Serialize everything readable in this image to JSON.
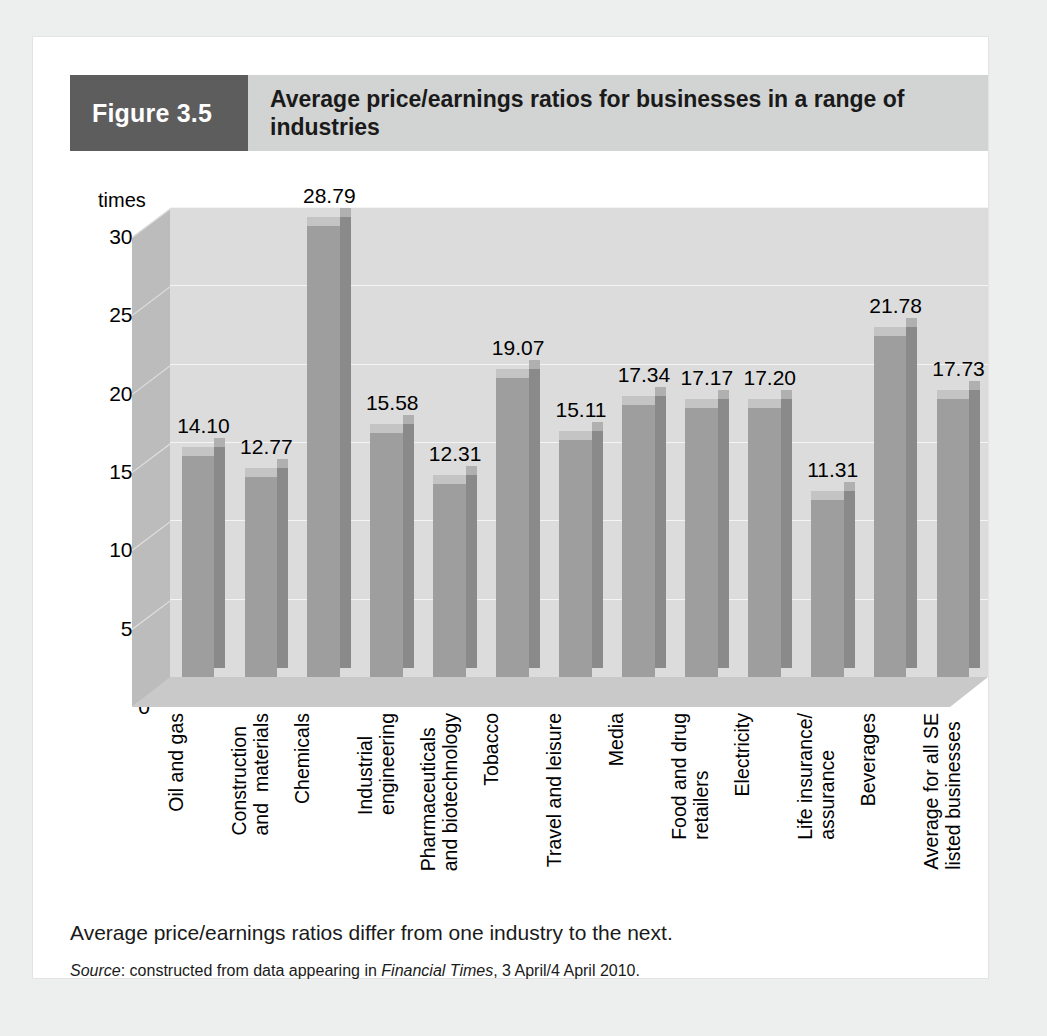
{
  "figure": {
    "label": "Figure 3.5",
    "title": "Average price/earnings ratios for businesses in a range of industries",
    "caption": "Average price/earnings ratios differ from one industry to the next.",
    "source_prefix": "Source",
    "source_mid": ": constructed from data appearing in ",
    "source_publication": "Financial Times",
    "source_suffix": ", 3 April/4 April 2010."
  },
  "colors": {
    "figure_label_bg": "#5d5d5d",
    "figure_title_bg": "#d2d3d3",
    "card_bg": "#ffffff",
    "page_bg": "#edeeee",
    "plot_bg": "#dcdcdc",
    "bar_front": "#9e9e9e",
    "bar_side": "#8a8a8a",
    "bar_top": "#c4c4c4",
    "gridline": "#f4f4f4"
  },
  "chart_data": {
    "type": "bar",
    "title": "Average price/earnings ratios for businesses in a range of industries",
    "xlabel": "",
    "ylabel": "times",
    "ylim": [
      0,
      30
    ],
    "yticks": [
      "0",
      "5.0",
      "10.0",
      "15.0",
      "20.0",
      "25.0",
      "30.0"
    ],
    "ytick_values": [
      0,
      5,
      10,
      15,
      20,
      25,
      30
    ],
    "grid": true,
    "legend": "none",
    "three_d": true,
    "categories": [
      "Oil and gas",
      "Construction and  materials",
      "Chemicals",
      "Industrial engineering",
      "Pharmaceuticals and biotechnology",
      "Tobacco",
      "Travel and leisure",
      "Media",
      "Food and drug retailers",
      "Electricity",
      "Life insurance/ assurance",
      "Beverages",
      "Average for all SE listed businesses"
    ],
    "category_lines": [
      [
        "Oil and gas"
      ],
      [
        "Construction",
        "and  materials"
      ],
      [
        "Chemicals"
      ],
      [
        "Industrial",
        "engineering"
      ],
      [
        "Pharmaceuticals",
        "and biotechnology"
      ],
      [
        "Tobacco"
      ],
      [
        "Travel and leisure"
      ],
      [
        "Media"
      ],
      [
        "Food and drug",
        "retailers"
      ],
      [
        "Electricity"
      ],
      [
        "Life insurance/",
        "assurance"
      ],
      [
        "Beverages"
      ],
      [
        "Average for all SE",
        "listed businesses"
      ]
    ],
    "values": [
      14.1,
      12.77,
      28.79,
      15.58,
      12.31,
      19.07,
      15.11,
      17.34,
      17.17,
      17.2,
      11.31,
      21.78,
      17.73
    ],
    "value_labels": [
      "14.10",
      "12.77",
      "28.79",
      "15.58",
      "12.31",
      "19.07",
      "15.11",
      "17.34",
      "17.17",
      "17.20",
      "11.31",
      "21.78",
      "17.73"
    ]
  }
}
